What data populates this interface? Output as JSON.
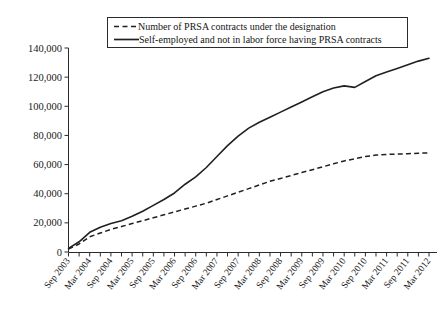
{
  "chart_data": {
    "type": "line",
    "title": "",
    "subtitle": "",
    "xlabel": "",
    "ylabel": "",
    "grid": false,
    "legend_position": "top-center",
    "ylim": [
      0,
      140000
    ],
    "yticks": [
      0,
      20000,
      40000,
      60000,
      80000,
      100000,
      120000,
      140000
    ],
    "ytick_labels": [
      "0",
      "20,000",
      "40,000",
      "60,000",
      "80,000",
      "100,000",
      "120,000",
      "140,000"
    ],
    "x": [
      "Sep 2003",
      "Dec 2003",
      "Mar 2004",
      "Jun 2004",
      "Sep 2004",
      "Dec 2004",
      "Mar 2005",
      "Jun 2005",
      "Sep 2005",
      "Dec 2005",
      "Mar 2006",
      "Jun 2006",
      "Sep 2006",
      "Dec 2006",
      "Mar 2007",
      "Jun 2007",
      "Sep 2007",
      "Dec 2007",
      "Mar 2008",
      "Jun 2008",
      "Sep 2008",
      "Dec 2008",
      "Mar 2009",
      "Jun 2009",
      "Sep 2009",
      "Dec 2009",
      "Mar 2010",
      "Jun 2010",
      "Sep 2010",
      "Dec 2010",
      "Mar 2011",
      "Jun 2011",
      "Sep 2011",
      "Dec 2011",
      "Mar 2012"
    ],
    "xtick_labels": [
      "Sep 2003",
      "Mar 2004",
      "Sep 2004",
      "Mar 2005",
      "Sep 2005",
      "Mar 2006",
      "Sep 2006",
      "Mar 2007",
      "Sep 2007",
      "Mar 2008",
      "Sep 2008",
      "Mar 2009",
      "Sep 2009",
      "Mar 2010",
      "Sep 2010",
      "Mar 2011",
      "Sep 2011",
      "Mar 2012"
    ],
    "series": [
      {
        "name": "Number of PRSA contracts under the designation",
        "style": "dashed",
        "values": [
          2000,
          5500,
          10500,
          13000,
          15500,
          17500,
          19500,
          21500,
          23500,
          25500,
          27500,
          29500,
          31500,
          33500,
          36000,
          38500,
          41000,
          43500,
          46000,
          48500,
          50500,
          52500,
          54500,
          56500,
          58500,
          60500,
          62500,
          64000,
          65500,
          66500,
          67000,
          67200,
          67400,
          67800,
          68000
        ]
      },
      {
        "name": "Self-employed and not in labor force having PRSA contracts",
        "style": "solid",
        "values": [
          2500,
          7000,
          13500,
          17000,
          19500,
          21500,
          24500,
          28000,
          32000,
          36000,
          40500,
          46500,
          51500,
          58000,
          65500,
          73000,
          79500,
          85000,
          89000,
          92500,
          96000,
          99500,
          103000,
          106500,
          110000,
          112500,
          114000,
          113000,
          117000,
          121000,
          123500,
          126000,
          128500,
          131000,
          133000
        ]
      }
    ]
  },
  "legend": {
    "entries": [
      {
        "label": "Number of PRSA contracts under the designation",
        "style": "dashed"
      },
      {
        "label": "Self-employed and not in labor force having PRSA contracts",
        "style": "solid"
      }
    ]
  }
}
